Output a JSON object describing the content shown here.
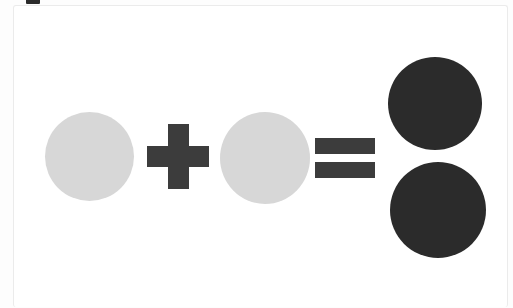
{
  "page": {
    "background_color": "#ffffff",
    "card_background_color": "#ffffff",
    "card_border_color": "#ebebeb",
    "top_mark_color": "#2b2b2b"
  },
  "palette": {
    "light_circle": "#d7d7d7",
    "dark_circle": "#2b2b2b",
    "operator": "#3c3c3c"
  },
  "equation": {
    "description": "one light circle plus one light circle equals two dark circles",
    "operator_plus": "+",
    "operator_equals": "=",
    "terms": [
      {
        "label": "1",
        "shape": "circle",
        "fill": "#d7d7d7",
        "count": 1
      },
      {
        "label": "1",
        "shape": "circle",
        "fill": "#d7d7d7",
        "count": 1
      }
    ],
    "result": {
      "label": "2",
      "shape": "circle",
      "fill": "#2b2b2b",
      "count": 2
    }
  },
  "shapes": {
    "operand_1_name": "light-circle-one",
    "operand_2_name": "light-circle-two",
    "result_1_name": "dark-circle-one",
    "result_2_name": "dark-circle-two"
  }
}
